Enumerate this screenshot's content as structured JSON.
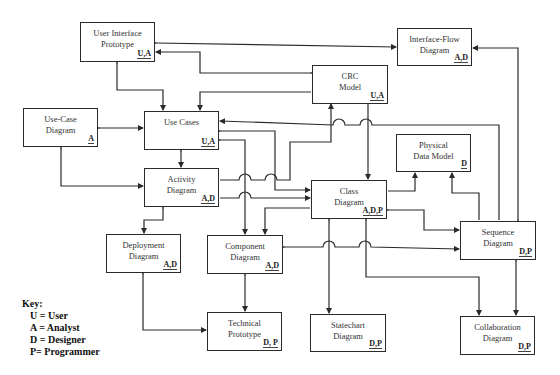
{
  "diagram": {
    "nodes": [
      {
        "id": "ui-prototype",
        "title": "User Interface\nPrototype",
        "roles": "U,A",
        "x": 80,
        "y": 22,
        "w": 75,
        "h": 40
      },
      {
        "id": "interface-flow",
        "title": "Interface-Flow\nDiagram",
        "roles": "A,D",
        "x": 397,
        "y": 28,
        "w": 75,
        "h": 38
      },
      {
        "id": "crc-model",
        "title": "CRC\nModel",
        "roles": "U,A",
        "x": 312,
        "y": 65,
        "w": 76,
        "h": 39
      },
      {
        "id": "use-case-diagram",
        "title": "Use-Case\nDiagram",
        "roles": "A",
        "x": 23,
        "y": 108,
        "w": 75,
        "h": 39
      },
      {
        "id": "use-cases",
        "title": "Use Cases",
        "roles": "U,A",
        "x": 144,
        "y": 111,
        "w": 75,
        "h": 39
      },
      {
        "id": "physical-data-model",
        "title": "Physical\nData Model",
        "roles": "D",
        "x": 396,
        "y": 134,
        "w": 75,
        "h": 38
      },
      {
        "id": "activity-diagram",
        "title": "Activity\nDiagram",
        "roles": "A,D",
        "x": 144,
        "y": 168,
        "w": 75,
        "h": 39
      },
      {
        "id": "class-diagram",
        "title": "Class\nDiagram",
        "roles": "A,D,P",
        "x": 311,
        "y": 180,
        "w": 76,
        "h": 39
      },
      {
        "id": "sequence-diagram",
        "title": "Sequence\nDiagram",
        "roles": "D,P",
        "x": 460,
        "y": 221,
        "w": 76,
        "h": 39
      },
      {
        "id": "deployment-diagram",
        "title": "Deployment\nDiagram",
        "roles": "A,D",
        "x": 106,
        "y": 234,
        "w": 75,
        "h": 39
      },
      {
        "id": "component-diagram",
        "title": "Component\nDiagram",
        "roles": "A,D",
        "x": 207,
        "y": 235,
        "w": 76,
        "h": 39
      },
      {
        "id": "technical-prototype",
        "title": "Technical\nPrototype",
        "roles": "D, P",
        "x": 207,
        "y": 312,
        "w": 75,
        "h": 39
      },
      {
        "id": "statechart-diagram",
        "title": "Statechart\nDiagram",
        "roles": "D,P",
        "x": 310,
        "y": 314,
        "w": 76,
        "h": 38
      },
      {
        "id": "collaboration-diagram",
        "title": "Collaboration\nDiagram",
        "roles": "D,P",
        "x": 460,
        "y": 316,
        "w": 75,
        "h": 39
      }
    ],
    "key": {
      "title": "Key:",
      "items": [
        "U = User",
        "A = Analyst",
        "D = Designer",
        "P= Programmer"
      ]
    },
    "colors": {
      "line": "#2a2a2a",
      "box_border": "#2a2a2a",
      "background": "#ffffff"
    }
  }
}
